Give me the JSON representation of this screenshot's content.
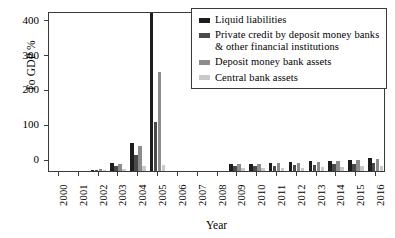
{
  "chart_data": {
    "type": "bar",
    "title": "",
    "xlabel": "Year",
    "ylabel": "To GDP %",
    "ylim": [
      0,
      460
    ],
    "yticks": [
      0,
      100,
      200,
      300,
      400
    ],
    "grid": false,
    "legend_position": "top-right",
    "categories": [
      "2000",
      "2001",
      "2002",
      "2003",
      "2004",
      "2005",
      "2006",
      "2007",
      "2008",
      "2009",
      "2010",
      "2011",
      "2012",
      "2013",
      "2014",
      "2015",
      "2016"
    ],
    "series": [
      {
        "name": "Liquid liabilities",
        "color": "#1d1d1d",
        "values": [
          0,
          0,
          4,
          22,
          80,
          455,
          0,
          0,
          0,
          21,
          21,
          24,
          26,
          28,
          30,
          33,
          36
        ]
      },
      {
        "name": "Private credit by deposit money banks & other financial institutions",
        "color": "#4a4a4a",
        "values": [
          0,
          0,
          3,
          14,
          45,
          140,
          0,
          0,
          0,
          13,
          13,
          15,
          16,
          17,
          19,
          21,
          23
        ]
      },
      {
        "name": "Deposit money bank assets",
        "color": "#8c8c8c",
        "values": [
          0,
          0,
          5,
          20,
          72,
          285,
          0,
          0,
          0,
          19,
          19,
          22,
          24,
          26,
          28,
          31,
          34
        ]
      },
      {
        "name": "Central bank assets",
        "color": "#c9c9c9",
        "values": [
          0,
          0,
          2,
          7,
          15,
          18,
          0,
          0,
          0,
          8,
          8,
          9,
          10,
          11,
          12,
          13,
          14
        ]
      }
    ]
  }
}
